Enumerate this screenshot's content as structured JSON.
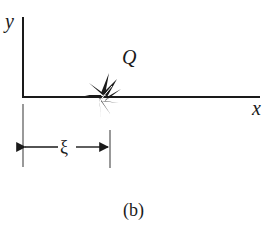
{
  "diagram": {
    "axes": {
      "x_label": "x",
      "y_label": "y"
    },
    "source": {
      "label": "Q",
      "description": "point source with radiating arrows on the x-axis"
    },
    "dimension": {
      "label": "ξ",
      "description": "distance from y-axis to source along x-axis"
    },
    "caption": "(b)",
    "colors": {
      "stroke": "#1a1a1a",
      "guide": "#555555",
      "background": "#ffffff"
    }
  }
}
